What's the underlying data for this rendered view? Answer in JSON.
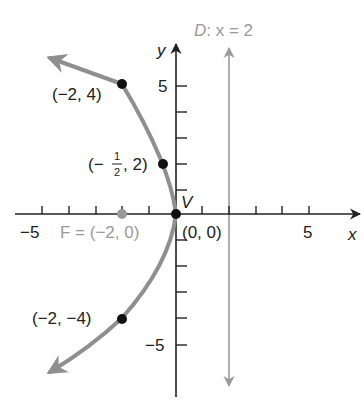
{
  "diagram": {
    "axes": {
      "x_label": "x",
      "y_label": "y",
      "x_tick_labels": [
        {
          "value": -5,
          "text": "−5"
        },
        {
          "value": 5,
          "text": "5"
        }
      ],
      "y_tick_labels": [
        {
          "value": 5,
          "text": "5"
        },
        {
          "value": -5,
          "text": "−5"
        }
      ],
      "x_range": [
        -6,
        7
      ],
      "y_range": [
        -7,
        6.5
      ]
    },
    "directrix": {
      "label": "D: x = 2",
      "label_prefix": "D",
      "label_eq": ": x = 2",
      "x": 2,
      "color": "#9a9a9a"
    },
    "focus": {
      "label": "F = (−2, 0)",
      "x": -2,
      "y": 0,
      "color": "#9a9a9a"
    },
    "vertex": {
      "label": "V",
      "coord_label": "(0, 0)",
      "x": 0,
      "y": 0
    },
    "points": [
      {
        "label": "(−2, 4)",
        "x": -2,
        "y": 4
      },
      {
        "label_open": "(−",
        "label_num": "1",
        "label_den": "2",
        "label_close": ", 2)",
        "x": -0.5,
        "y": 2
      },
      {
        "label": "(−2, −4)",
        "x": -2,
        "y": -4
      }
    ],
    "curve": {
      "equation": "y^2 = -8x",
      "color": "#8f8f8f"
    },
    "colors": {
      "axis": "#222222",
      "curve": "#8f8f8f",
      "directrix": "#9a9a9a",
      "point": "#111111",
      "focus": "#9a9a9a"
    }
  }
}
